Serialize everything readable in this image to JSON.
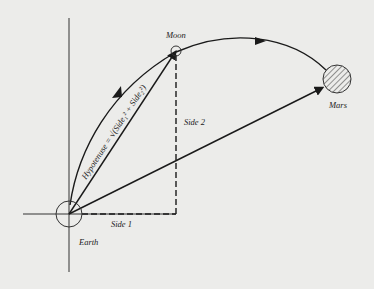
{
  "diagram": {
    "labels": {
      "moon": "Moon",
      "mars": "Mars",
      "earth": "Earth",
      "side1": "Side 1",
      "side2": "Side 2",
      "hypotenuse": "Hypotenuse = √(Side₁² + Side₂²)"
    },
    "colors": {
      "background": "#ececea",
      "ink": "#1a1a1a"
    }
  }
}
